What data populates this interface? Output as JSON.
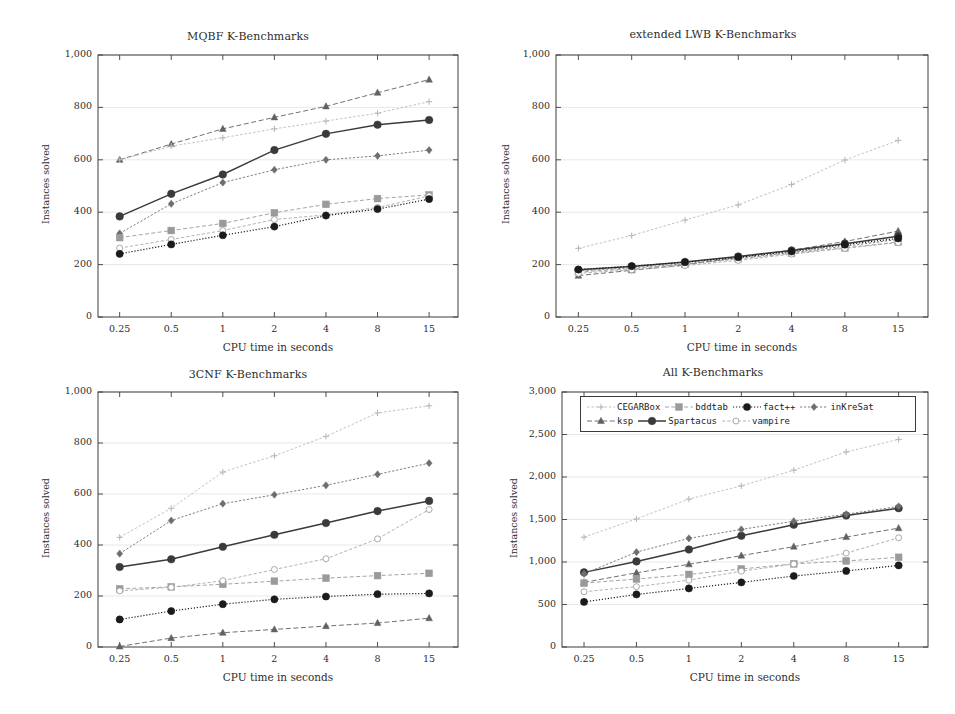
{
  "figure": {
    "width": 955,
    "height": 714,
    "axis_label_x": "CPU time in seconds",
    "axis_label_y": "Instances solved"
  },
  "legend": {
    "position": "top-left-inside-panel-4",
    "entries": [
      {
        "label": "CEGARBox",
        "color": "#b9b9b9",
        "marker": "plus",
        "dash": "2.4,2.0",
        "width": 0.9,
        "msize": 2.6
      },
      {
        "label": "bddtab",
        "color": "#9a9a9a",
        "marker": "square",
        "dash": "4,2.4",
        "width": 0.9,
        "msize": 3.4
      },
      {
        "label": "fact++",
        "color": "#1b1b1b",
        "marker": "circle",
        "dash": "1.2,1.8",
        "width": 1.2,
        "msize": 3.6
      },
      {
        "label": "inKreSat",
        "color": "#6e6e6e",
        "marker": "diamond",
        "dash": "2.2,1.8",
        "width": 0.9,
        "msize": 3.0
      },
      {
        "label": "ksp",
        "color": "#616161",
        "marker": "triangle",
        "dash": "5,2.6",
        "width": 0.9,
        "msize": 3.2
      },
      {
        "label": "Spartacus",
        "color": "#3a3a3a",
        "marker": "circle",
        "dash": "none",
        "width": 1.5,
        "msize": 3.8
      },
      {
        "label": "vampire",
        "color": "#a9a9a9",
        "marker": "circle-open",
        "dash": "3.2,2.0",
        "width": 0.9,
        "msize": 3.0
      }
    ]
  },
  "chart_data": [
    {
      "id": "mqbf",
      "type": "line",
      "title": "MQBF K-Benchmarks",
      "xlabel": "CPU time in seconds",
      "ylabel": "Instances solved",
      "x": [
        0.25,
        0.5,
        1,
        2,
        4,
        8,
        15
      ],
      "xticklabels": [
        "0.25",
        "0.5",
        "1",
        "2",
        "4",
        "8",
        "15"
      ],
      "ylim": [
        0,
        1000
      ],
      "yticks": [
        0,
        200,
        400,
        600,
        800,
        1000
      ],
      "yticklabels": [
        "0",
        "200",
        "400",
        "600",
        "800",
        "1,000"
      ],
      "grid": true,
      "series": [
        {
          "name": "CEGARBox",
          "values": [
            600,
            652,
            684,
            718,
            748,
            778,
            822
          ]
        },
        {
          "name": "bddtab",
          "values": [
            303,
            330,
            357,
            398,
            430,
            452,
            466
          ]
        },
        {
          "name": "fact++",
          "values": [
            241,
            277,
            312,
            345,
            387,
            412,
            450
          ]
        },
        {
          "name": "inKreSat",
          "values": [
            319,
            432,
            513,
            562,
            600,
            615,
            637
          ]
        },
        {
          "name": "ksp",
          "values": [
            600,
            660,
            718,
            762,
            804,
            856,
            906
          ]
        },
        {
          "name": "Spartacus",
          "values": [
            384,
            470,
            544,
            637,
            699,
            734,
            752
          ]
        },
        {
          "name": "vampire",
          "values": [
            263,
            296,
            330,
            372,
            390,
            418,
            462
          ]
        }
      ]
    },
    {
      "id": "lwb",
      "type": "line",
      "title": "extended LWB K-Benchmarks",
      "xlabel": "CPU time in seconds",
      "ylabel": "Instances solved",
      "x": [
        0.25,
        0.5,
        1,
        2,
        4,
        8,
        15
      ],
      "xticklabels": [
        "0.25",
        "0.5",
        "1",
        "2",
        "4",
        "8",
        "15"
      ],
      "ylim": [
        0,
        1000
      ],
      "yticks": [
        0,
        200,
        400,
        600,
        800,
        1000
      ],
      "yticklabels": [
        "0",
        "200",
        "400",
        "600",
        "800",
        "1,000"
      ],
      "grid": true,
      "series": [
        {
          "name": "CEGARBox",
          "values": [
            262,
            311,
            370,
            428,
            506,
            599,
            674
          ]
        },
        {
          "name": "bddtab",
          "values": [
            172,
            184,
            201,
            222,
            243,
            264,
            286
          ]
        },
        {
          "name": "fact++",
          "values": [
            181,
            194,
            209,
            228,
            250,
            276,
            300
          ]
        },
        {
          "name": "inKreSat",
          "values": [
            176,
            188,
            203,
            224,
            246,
            270,
            296
          ]
        },
        {
          "name": "ksp",
          "values": [
            158,
            178,
            199,
            228,
            255,
            288,
            328
          ]
        },
        {
          "name": "Spartacus",
          "values": [
            180,
            193,
            210,
            231,
            254,
            280,
            308
          ]
        },
        {
          "name": "vampire",
          "values": [
            167,
            180,
            196,
            216,
            240,
            262,
            284
          ]
        }
      ]
    },
    {
      "id": "3cnf",
      "type": "line",
      "title": "3CNF K-Benchmarks",
      "xlabel": "CPU time in seconds",
      "ylabel": "Instances solved",
      "x": [
        0.25,
        0.5,
        1,
        2,
        4,
        8,
        15
      ],
      "xticklabels": [
        "0.25",
        "0.5",
        "1",
        "2",
        "4",
        "8",
        "15"
      ],
      "ylim": [
        0,
        1000
      ],
      "yticks": [
        0,
        200,
        400,
        600,
        800,
        1000
      ],
      "yticklabels": [
        "0",
        "200",
        "400",
        "600",
        "800",
        "1,000"
      ],
      "grid": true,
      "series": [
        {
          "name": "CEGARBox",
          "values": [
            430,
            544,
            686,
            750,
            826,
            918,
            946
          ]
        },
        {
          "name": "bddtab",
          "values": [
            228,
            236,
            246,
            258,
            270,
            280,
            289
          ]
        },
        {
          "name": "fact++",
          "values": [
            108,
            141,
            168,
            187,
            198,
            207,
            210
          ]
        },
        {
          "name": "inKreSat",
          "values": [
            366,
            496,
            562,
            597,
            634,
            677,
            721
          ]
        },
        {
          "name": "ksp",
          "values": [
            2,
            35,
            56,
            69,
            82,
            94,
            113
          ]
        },
        {
          "name": "Spartacus",
          "values": [
            314,
            344,
            393,
            440,
            486,
            533,
            573
          ]
        },
        {
          "name": "vampire",
          "values": [
            220,
            234,
            260,
            304,
            346,
            424,
            539
          ]
        }
      ]
    },
    {
      "id": "all",
      "type": "line",
      "title": "All K-Benchmarks",
      "xlabel": "CPU time in seconds",
      "ylabel": "Instances solved",
      "x": [
        0.25,
        0.5,
        1,
        2,
        4,
        8,
        15
      ],
      "xticklabels": [
        "0.25",
        "0.5",
        "1",
        "2",
        "4",
        "8",
        "15"
      ],
      "ylim": [
        0,
        3000
      ],
      "yticks": [
        0,
        500,
        1000,
        1500,
        2000,
        2500,
        3000
      ],
      "yticklabels": [
        "0",
        "500",
        "1,000",
        "1,500",
        "2,000",
        "2,500",
        "3,000"
      ],
      "grid": true,
      "series": [
        {
          "name": "CEGARBox",
          "values": [
            1292,
            1507,
            1740,
            1896,
            2080,
            2295,
            2442
          ]
        },
        {
          "name": "bddtab",
          "values": [
            751,
            800,
            854,
            918,
            978,
            1012,
            1055
          ]
        },
        {
          "name": "fact++",
          "values": [
            530,
            618,
            689,
            760,
            835,
            895,
            960
          ]
        },
        {
          "name": "inKreSat",
          "values": [
            861,
            1116,
            1278,
            1383,
            1480,
            1562,
            1654
          ]
        },
        {
          "name": "ksp",
          "values": [
            760,
            873,
            973,
            1075,
            1181,
            1294,
            1398
          ]
        },
        {
          "name": "Spartacus",
          "values": [
            878,
            1007,
            1147,
            1308,
            1439,
            1547,
            1633
          ]
        },
        {
          "name": "vampire",
          "values": [
            650,
            710,
            786,
            892,
            976,
            1104,
            1285
          ]
        }
      ]
    }
  ]
}
